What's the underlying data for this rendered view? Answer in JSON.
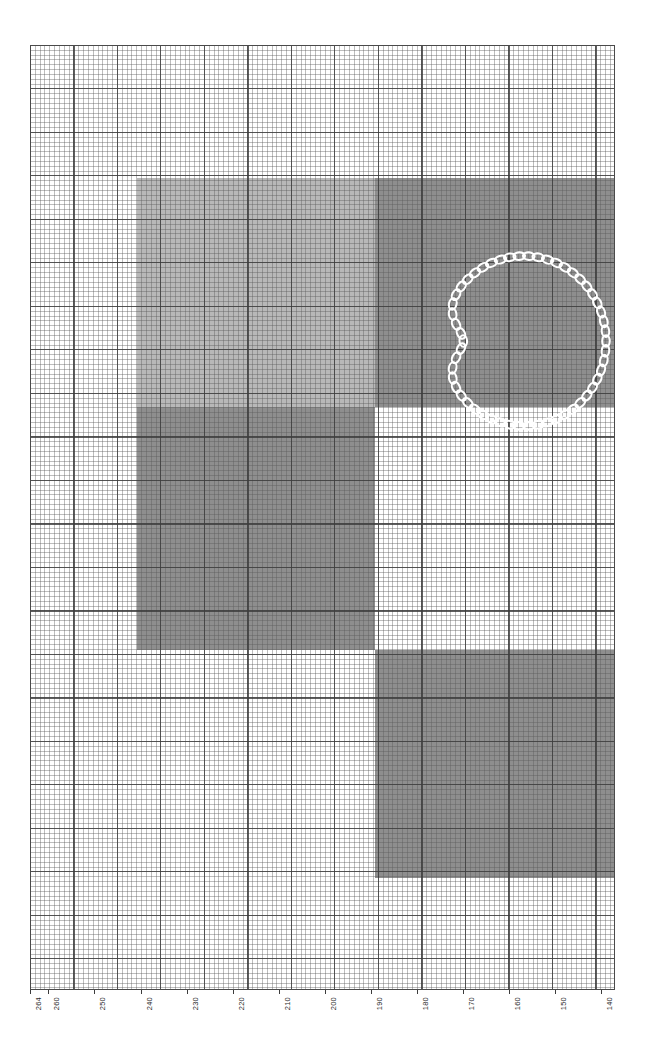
{
  "figure": {
    "kind": "graph-paper-plot",
    "background_color": "#ffffff",
    "grid_major_color": "#3c3c3c",
    "grid_minor_color": "#5a5a5a",
    "curve_color": "#ffffff"
  },
  "x_axis": {
    "name": "x-axis",
    "orientation": "horizontal",
    "direction": "descending",
    "label_rotation_deg": -90,
    "min": 137,
    "max": 264,
    "tick_labels": [
      "264",
      "260",
      "250",
      "240",
      "230",
      "220",
      "210",
      "200",
      "190",
      "180",
      "170",
      "160",
      "150",
      "140"
    ],
    "tick_values": [
      264,
      260,
      250,
      240,
      230,
      220,
      210,
      200,
      190,
      180,
      170,
      160,
      150,
      140
    ]
  },
  "chart_data": {
    "type": "heatmap",
    "title": "",
    "subtitle": "",
    "xlabel": "",
    "ylabel": "",
    "grid": true,
    "legend": "none",
    "xlim": [
      264,
      137
    ],
    "ylim": [
      0,
      945
    ],
    "palette": {
      "white": "#ffffff",
      "light_gray": "#b8b8b8",
      "dark_gray": "#8e8e8e",
      "curve": "#ffffff"
    },
    "blocks": [
      {
        "name": "upper-left-light-block",
        "shade": "light_gray",
        "color": "#b8b8b8",
        "x_start": 240,
        "x_end": 209,
        "px": {
          "left": 107,
          "top": 133,
          "width": 238,
          "height": 229
        }
      },
      {
        "name": "upper-right-dark-block",
        "shade": "dark_gray",
        "color": "#8e8e8e",
        "x_start": 209,
        "x_end": 155,
        "px": {
          "left": 345,
          "top": 133,
          "width": 240,
          "height": 229
        }
      },
      {
        "name": "middle-left-dark-block",
        "shade": "dark_gray",
        "color": "#8e8e8e",
        "x_start": 240,
        "x_end": 209,
        "px": {
          "left": 107,
          "top": 362,
          "width": 238,
          "height": 243
        }
      },
      {
        "name": "lower-right-dark-block",
        "shade": "dark_gray",
        "color": "#8e8e8e",
        "x_start": 209,
        "x_end": 155,
        "px": {
          "left": 345,
          "top": 605,
          "width": 240,
          "height": 228
        }
      }
    ],
    "watermark": {
      "name": "diagonal-scuff-watermark",
      "px": {
        "left": 107,
        "top": 605,
        "width": 238,
        "height": 228
      }
    },
    "curve": {
      "name": "chain-closed-curve",
      "style": "beaded-chain",
      "closed": true,
      "color": "#ffffff",
      "bead_count": 54,
      "bead_radius_px": 4.6,
      "center_px": {
        "x": 494,
        "y": 296
      },
      "radii_px": {
        "rx": 82,
        "ry": 85
      },
      "cusp_angle_deg": 180,
      "cusp_depth": 0.26,
      "rotation_deg": 0
    }
  }
}
